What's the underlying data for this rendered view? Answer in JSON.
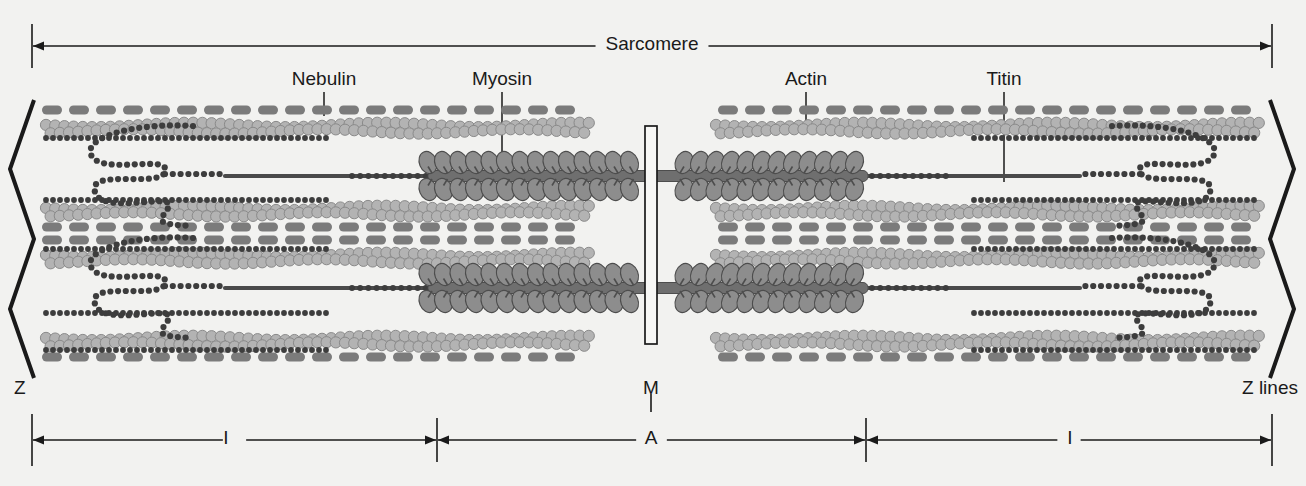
{
  "diagram": {
    "background_color": "#f2f2f0",
    "ink_color": "#1a1a1a",
    "colors": {
      "nebulin_band": "#7b7b7b",
      "actin_bead_fill": "#b3b3b3",
      "actin_bead_stroke": "#8a8a8a",
      "myosin_head": "#8d8d8d",
      "myosin_head_stroke": "#4d4d4d",
      "titin_dots": "#3d3d3d",
      "zline": "#1a1a1a",
      "mline_fill": "#f7f7f5",
      "mline_stroke": "#1a1a1a"
    }
  },
  "top_scale": {
    "label": "Sarcomere",
    "left_tick_x": 32,
    "right_tick_x": 1272,
    "arrow_y": 46
  },
  "callouts": [
    {
      "name": "nebulin",
      "label": "Nebulin",
      "x": 324,
      "text_y": 84,
      "line_from_y": 92,
      "line_to_y": 116
    },
    {
      "name": "myosin",
      "label": "Myosin",
      "x": 502,
      "text_y": 84,
      "line_from_y": 92,
      "line_to_y": 166
    },
    {
      "name": "actin",
      "label": "Actin",
      "x": 806,
      "text_y": 84,
      "line_from_y": 92,
      "line_to_y": 134
    },
    {
      "name": "titin",
      "label": "Titin",
      "x": 1004,
      "text_y": 84,
      "line_from_y": 92,
      "line_to_y": 182
    }
  ],
  "structure_labels": {
    "z_left": "Z",
    "z_right": "Z lines",
    "m_line": "M",
    "a_band": "A",
    "i_band_left": "I",
    "i_band_right": "I"
  },
  "bottom_scale": {
    "y": 440,
    "z_left_tick_x": 32,
    "z_right_tick_x": 1272,
    "a_left_tick_x": 437,
    "a_right_tick_x": 866,
    "i_left_label_x": 226,
    "i_right_label_x": 1070,
    "a_label_x": 651,
    "m_label_x": 651,
    "m_label_y": 392,
    "z_left_label_x": 14,
    "z_left_label_y": 392,
    "z_right_label_x": 1242,
    "z_right_label_y": 392
  },
  "chart_data": {
    "type": "diagram",
    "title": "Sarcomere",
    "components": [
      {
        "name": "Z line",
        "count": 2,
        "role": "sarcomere boundary, zig-zag",
        "position": "both ends"
      },
      {
        "name": "M line",
        "count": 1,
        "role": "central anchoring line",
        "position": "center"
      },
      {
        "name": "Nebulin",
        "count": 8,
        "role": "dashed band along thin filament",
        "position": "paired with actin"
      },
      {
        "name": "Actin",
        "count": 8,
        "role": "thin filament double-bead helix",
        "position": "I-band and part of A-band"
      },
      {
        "name": "Myosin",
        "count": 2,
        "role": "thick filament with projecting heads",
        "position": "A-band"
      },
      {
        "name": "Titin",
        "count": 4,
        "role": "elastic dotted spring from Z line to thick filament",
        "position": "I-band"
      }
    ],
    "bands": [
      {
        "name": "I",
        "span_px": [
          32,
          437
        ],
        "side": "left"
      },
      {
        "name": "A",
        "span_px": [
          437,
          866
        ],
        "side": "center"
      },
      {
        "name": "I",
        "span_px": [
          866,
          1272
        ],
        "side": "right"
      }
    ],
    "overall_span_px": [
      32,
      1272
    ],
    "overall_label": "Sarcomere"
  }
}
